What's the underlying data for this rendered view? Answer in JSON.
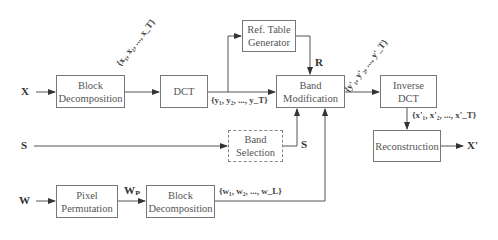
{
  "diagram": {
    "inputs": {
      "x": "X",
      "s": "S",
      "w": "W"
    },
    "output": "X'",
    "boxes": {
      "block_decomp_top": "Block\nDecomposition",
      "dct": "DCT",
      "ref_table": "Ref. Table\nGenerator",
      "band_mod": "Band\nModification",
      "inverse_dct": "Inverse\nDCT",
      "reconstruction": "Reconstruction",
      "band_selection": "Band\nSelection",
      "pixel_perm": "Pixel\nPermutation",
      "block_decomp_bottom": "Block\nDecomposition"
    },
    "edge_labels": {
      "x_blocks": "{x₁, x₂, ..., x_T}",
      "y_coeffs": "{y₁, y₂, ..., y_T}",
      "r": "R",
      "y_mod": "{y'₁, y'₂, ..., y'_T}",
      "x_rec": "{x'₁, x'₂, ..., x'_T}",
      "s_sel": "S",
      "wp": "Wₚ",
      "w_blocks": "{w₁, w₂, ..., w_L}"
    }
  }
}
